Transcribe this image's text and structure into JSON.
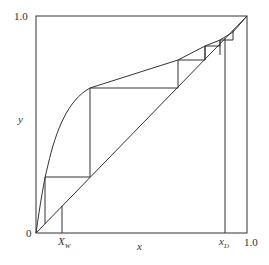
{
  "diagram": {
    "type": "McCabe-Thiele distillation diagram",
    "axis": {
      "x_label": "x",
      "y_label": "y",
      "origin_label": "0",
      "x_max_label": "1.0",
      "y_max_label": "1.0"
    },
    "markers": {
      "xw_main": "X",
      "xw_sub": "W",
      "xd_main": "x",
      "xd_sub": "D"
    },
    "colors": {
      "line": "#333333",
      "background": "#ffffff"
    },
    "elements": [
      "plot-frame",
      "diagonal-line",
      "equilibrium-curve",
      "operating-steps",
      "xw-marker-line",
      "xd-marker-line"
    ]
  }
}
